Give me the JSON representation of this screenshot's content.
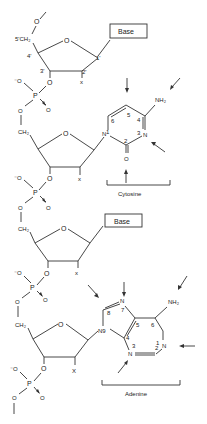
{
  "diagram": {
    "type": "nucleic-acid-backbone-structure",
    "base_box_label": "Base",
    "sugar_labels": {
      "c5": "5'CH₂",
      "c4": "4'",
      "c3": "3'",
      "c2": "2'",
      "c1": "1'",
      "ring_o": "O",
      "x": "x"
    },
    "phosphate": {
      "p": "P",
      "o_minus": "⁻O",
      "o": "O"
    },
    "ch2": "CH₂",
    "nh2": "NH₂",
    "cytosine": {
      "label": "Cytosine",
      "atoms": {
        "n1": "N",
        "n1_num": "1",
        "c2": "2",
        "n3": "N",
        "n3_num": "3",
        "c4": "4",
        "c5": "5",
        "c6": "6",
        "o": "O"
      }
    },
    "adenine": {
      "label": "Adenine",
      "atoms": {
        "n9": "N9",
        "c8": "8",
        "n7": "N",
        "n7_num": "7",
        "c5": "5",
        "c4": "4",
        "n3": "N",
        "n3_num": "3",
        "c2": "2",
        "n1": "N",
        "n1_num": "1",
        "c6": "6"
      }
    },
    "x_label": "X"
  }
}
